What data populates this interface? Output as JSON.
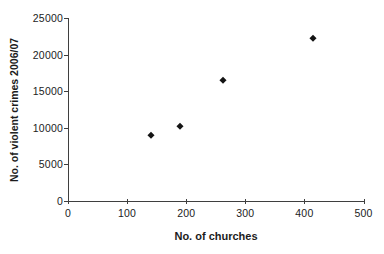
{
  "chart_data": {
    "type": "scatter",
    "title": "",
    "xlabel": "No. of churches",
    "ylabel": "No. of violent crimes 2006/07",
    "xlim": [
      0,
      500
    ],
    "ylim": [
      0,
      25000
    ],
    "x_ticks": [
      0,
      100,
      200,
      300,
      400,
      500
    ],
    "y_ticks": [
      0,
      5000,
      10000,
      15000,
      20000,
      25000
    ],
    "grid": false,
    "legend_position": "none",
    "marker": "diamond",
    "points": [
      {
        "x": 140,
        "y": 9000
      },
      {
        "x": 190,
        "y": 10300
      },
      {
        "x": 262,
        "y": 16500
      },
      {
        "x": 415,
        "y": 22200
      }
    ]
  },
  "colors": {
    "background": "#ffffff",
    "axis": "#3f3f3f",
    "text": "#1c1c1c",
    "marker": "#141414"
  }
}
